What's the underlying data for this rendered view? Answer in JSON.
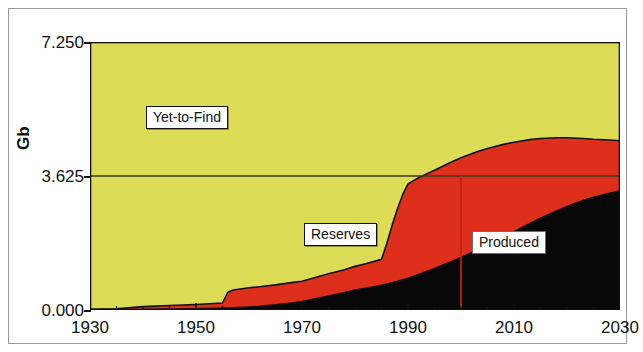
{
  "figure": {
    "background": "#ffffff",
    "frame_color": "#9a9a9a"
  },
  "axes": {
    "ylabel": "Gb",
    "yticks": [
      "0.000",
      "3.625",
      "7.250"
    ],
    "xticks": [
      "1930",
      "1950",
      "1970",
      "1990",
      "2010",
      "2030"
    ]
  },
  "labels": {
    "yet_to_find": "Yet-to-Find",
    "reserves": "Reserves",
    "produced": "Produced"
  },
  "colors": {
    "yet_to_find": "#dcdc57",
    "reserves": "#de2f1d",
    "produced": "#080808",
    "outline": "#111111",
    "marker_line": "#c0201a",
    "gridline": "#3a3a20"
  },
  "chart_data": {
    "type": "area",
    "title": "",
    "xlabel": "",
    "ylabel": "Gb",
    "xlim": [
      1930,
      2030
    ],
    "ylim": [
      0.0,
      7.25
    ],
    "yticks": [
      0.0,
      3.625,
      7.25
    ],
    "xticks": [
      1930,
      1950,
      1970,
      1990,
      2010,
      2030
    ],
    "grid": false,
    "stacked": true,
    "legend": "inline-labels",
    "annotations": [
      {
        "text": "Yet-to-Find",
        "x": 1960,
        "y": 5.4
      },
      {
        "text": "Reserves",
        "x": 1995,
        "y": 1.9
      },
      {
        "text": "Produced",
        "x": 2017,
        "y": 1.8
      },
      {
        "text": "half-way marker line",
        "x": 2000,
        "y": 3.625
      }
    ],
    "marker_line": {
      "x": 2000,
      "y_from": 0.0,
      "y_to": 3.625,
      "color": "#c0201a"
    },
    "gridline_y": 3.625,
    "x": [
      1930,
      1935,
      1940,
      1945,
      1950,
      1955,
      1956,
      1957,
      1960,
      1962,
      1965,
      1968,
      1970,
      1973,
      1975,
      1978,
      1980,
      1982,
      1985,
      1986,
      1987,
      1988,
      1989,
      1990,
      1992,
      1995,
      1998,
      2000,
      2003,
      2005,
      2008,
      2010,
      2013,
      2015,
      2018,
      2020,
      2023,
      2025,
      2028,
      2030
    ],
    "series": [
      {
        "name": "Produced",
        "color": "#080808",
        "values": [
          0.0,
          0.0,
          0.01,
          0.02,
          0.03,
          0.05,
          0.05,
          0.06,
          0.08,
          0.1,
          0.14,
          0.19,
          0.23,
          0.32,
          0.38,
          0.47,
          0.54,
          0.59,
          0.67,
          0.7,
          0.74,
          0.78,
          0.82,
          0.86,
          0.96,
          1.12,
          1.3,
          1.42,
          1.62,
          1.76,
          1.98,
          2.12,
          2.34,
          2.48,
          2.68,
          2.8,
          2.96,
          3.05,
          3.16,
          3.22
        ]
      },
      {
        "name": "Reserves",
        "color": "#de2f1d",
        "values": [
          0.02,
          0.03,
          0.08,
          0.1,
          0.12,
          0.14,
          0.43,
          0.48,
          0.52,
          0.53,
          0.54,
          0.55,
          0.55,
          0.58,
          0.6,
          0.62,
          0.64,
          0.66,
          0.7,
          1.1,
          1.55,
          1.95,
          2.3,
          2.55,
          2.62,
          2.66,
          2.69,
          2.7,
          2.66,
          2.61,
          2.5,
          2.42,
          2.27,
          2.16,
          1.98,
          1.86,
          1.68,
          1.57,
          1.44,
          1.36
        ]
      },
      {
        "name": "Yet-to-Find",
        "color": "#dcdc57",
        "values": [
          7.23,
          7.22,
          7.16,
          7.13,
          7.1,
          7.06,
          6.77,
          6.71,
          6.65,
          6.62,
          6.57,
          6.51,
          6.47,
          6.35,
          6.27,
          6.16,
          6.07,
          6.0,
          5.88,
          5.45,
          4.96,
          4.52,
          4.13,
          3.84,
          3.67,
          3.47,
          3.26,
          3.13,
          2.97,
          2.88,
          2.77,
          2.71,
          2.64,
          2.61,
          2.59,
          2.59,
          2.61,
          2.63,
          2.65,
          2.67
        ]
      }
    ],
    "total": 7.25
  }
}
